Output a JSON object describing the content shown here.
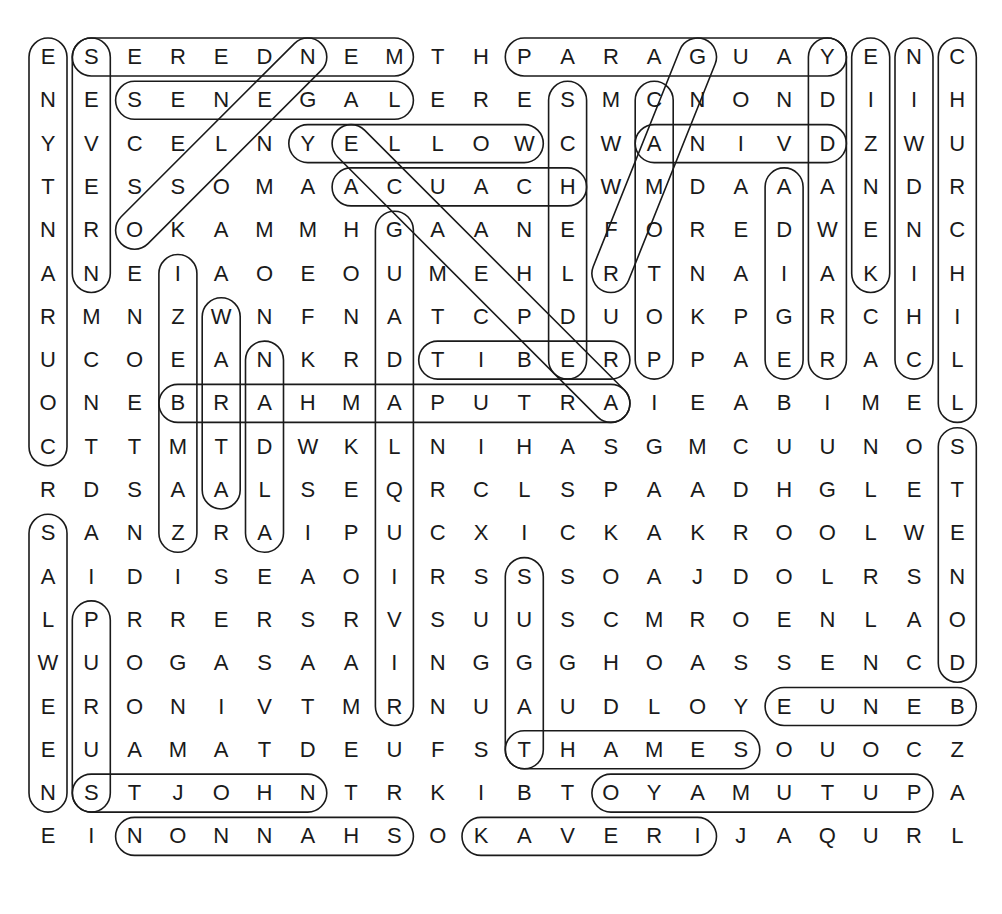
{
  "puzzle": {
    "title": "",
    "layout": {
      "origin_x": 48,
      "origin_y": 57,
      "step_x": 43.3,
      "step_y": 43.3,
      "loop_half_height": 19
    },
    "rows": [
      "ESEREDNEMTHPARAGUAYENC",
      "NESENEGALERESMCNONDIIH",
      "YVCELNYELLOWCWANIVDZWU",
      "TESSOMAACUACHWMDAAANDR",
      "NROKAMMHGAANEFOREDWENC",
      "ANEIAOEOUMEHLRTNAIAKIH",
      "RMNZWNFNATCPDUOKPGRCHI",
      "UCOEANKRDTIBERPPAERACL",
      "ONEBRAHMAPUTRAIEABIMEL",
      "CTTMTDWKLNIHASGMCUUNOS",
      "RDSAALSEQRCLSPAADHGLET",
      "SANZRAIPUCXICKAKROOLWE",
      "AIDISEAOIRSSSOAJDOLRSN",
      "LPRRERSRVSUUSCMROENLAO",
      "WUOGASAAINGGGHOASSENCD",
      "ERONIVTMRNUAUDLOYEUNEB",
      "EUAMATDEUFSTHAMESOUOCZ",
      "NSTJOHNTRKIBTOYAMUTUPA",
      "EINONNAHSOKAVERIJAQURL"
    ],
    "found_words": [
      {
        "word": "MENDERES",
        "start": [
          0,
          8
        ],
        "end": [
          0,
          1
        ]
      },
      {
        "word": "PARAGUAY",
        "start": [
          0,
          11
        ],
        "end": [
          0,
          18
        ]
      },
      {
        "word": "SENEGAL",
        "start": [
          1,
          2
        ],
        "end": [
          1,
          8
        ]
      },
      {
        "word": "YELLOW",
        "start": [
          2,
          6
        ],
        "end": [
          2,
          11
        ]
      },
      {
        "word": "DVINA",
        "start": [
          2,
          18
        ],
        "end": [
          2,
          14
        ]
      },
      {
        "word": "CAUCA",
        "start": [
          3,
          12
        ],
        "end": [
          3,
          7
        ]
      },
      {
        "word": "TIBER",
        "start": [
          7,
          9
        ],
        "end": [
          7,
          13
        ]
      },
      {
        "word": "BRAHMAPUTRA",
        "start": [
          8,
          3
        ],
        "end": [
          8,
          13
        ]
      },
      {
        "word": "EUNEB",
        "start": [
          15,
          21
        ],
        "end": [
          15,
          17
        ]
      },
      {
        "word": "THAMES",
        "start": [
          16,
          11
        ],
        "end": [
          16,
          16
        ]
      },
      {
        "word": "STJOHN",
        "start": [
          17,
          1
        ],
        "end": [
          17,
          6
        ]
      },
      {
        "word": "PUTUMAYO",
        "start": [
          17,
          20
        ],
        "end": [
          17,
          13
        ]
      },
      {
        "word": "SHANNON",
        "start": [
          18,
          8
        ],
        "end": [
          18,
          2
        ]
      },
      {
        "word": "KAVERI",
        "start": [
          18,
          10
        ],
        "end": [
          18,
          15
        ]
      },
      {
        "word": "ENYTNARUOC",
        "start": [
          0,
          0
        ],
        "end": [
          9,
          0
        ]
      },
      {
        "word": "SEVERN",
        "start": [
          0,
          1
        ],
        "end": [
          5,
          1
        ]
      },
      {
        "word": "EIZNEK",
        "start": [
          0,
          19
        ],
        "end": [
          5,
          19
        ]
      },
      {
        "word": "NIWDNIHC",
        "start": [
          0,
          20
        ],
        "end": [
          7,
          20
        ]
      },
      {
        "word": "CHURCHILL",
        "start": [
          0,
          21
        ],
        "end": [
          8,
          21
        ]
      },
      {
        "word": "YDDAWARRA",
        "start": [
          0,
          18
        ],
        "end": [
          7,
          18
        ]
      },
      {
        "word": "SCHELDE",
        "start": [
          1,
          12
        ],
        "end": [
          7,
          12
        ]
      },
      {
        "word": "CAMOTOP",
        "start": [
          1,
          14
        ],
        "end": [
          7,
          14
        ]
      },
      {
        "word": "ADIGE",
        "start": [
          3,
          17
        ],
        "end": [
          7,
          17
        ]
      },
      {
        "word": "GUADALQUIVIR",
        "start": [
          4,
          8
        ],
        "end": [
          15,
          8
        ]
      },
      {
        "word": "IZEBMAZ",
        "start": [
          5,
          3
        ],
        "end": [
          11,
          3
        ]
      },
      {
        "word": "WATTA",
        "start": [
          6,
          4
        ],
        "end": [
          10,
          4
        ]
      },
      {
        "word": "NDLA",
        "start": [
          7,
          5
        ],
        "end": [
          11,
          5
        ]
      },
      {
        "word": "STENOD",
        "start": [
          9,
          21
        ],
        "end": [
          14,
          21
        ]
      },
      {
        "word": "SALWEEN",
        "start": [
          11,
          0
        ],
        "end": [
          17,
          0
        ]
      },
      {
        "word": "PURUS",
        "start": [
          13,
          1
        ],
        "end": [
          17,
          1
        ]
      },
      {
        "word": "SUGAT",
        "start": [
          12,
          11
        ],
        "end": [
          16,
          11
        ]
      },
      {
        "word": "NIGER",
        "start": [
          0,
          6
        ],
        "end": [
          4,
          2
        ]
      },
      {
        "word": "NAMIBEN",
        "start": [
          0,
          15
        ],
        "end": [
          5,
          13
        ]
      },
      {
        "word": "EIRE",
        "start": [
          2,
          7
        ],
        "end": [
          8,
          13
        ]
      }
    ]
  }
}
